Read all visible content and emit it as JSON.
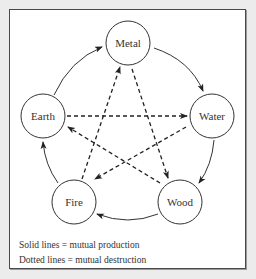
{
  "diagram": {
    "nodes": [
      {
        "id": "metal",
        "label": "Metal",
        "cx": 128,
        "cy": 43
      },
      {
        "id": "water",
        "label": "Water",
        "cx": 212,
        "cy": 116
      },
      {
        "id": "wood",
        "label": "Wood",
        "cx": 180,
        "cy": 202
      },
      {
        "id": "fire",
        "label": "Fire",
        "cx": 74,
        "cy": 202
      },
      {
        "id": "earth",
        "label": "Earth",
        "cx": 43,
        "cy": 116
      }
    ],
    "production_edges": [
      {
        "from": "Earth",
        "to": "Metal",
        "style": "solid"
      },
      {
        "from": "Metal",
        "to": "Water",
        "style": "solid"
      },
      {
        "from": "Water",
        "to": "Wood",
        "style": "solid"
      },
      {
        "from": "Wood",
        "to": "Fire",
        "style": "solid"
      },
      {
        "from": "Fire",
        "to": "Earth",
        "style": "solid"
      }
    ],
    "destruction_edges": [
      {
        "from": "Earth",
        "to": "Water",
        "style": "dashed"
      },
      {
        "from": "Water",
        "to": "Fire",
        "style": "dashed"
      },
      {
        "from": "Fire",
        "to": "Metal",
        "style": "dashed"
      },
      {
        "from": "Metal",
        "to": "Wood",
        "style": "dashed"
      },
      {
        "from": "Wood",
        "to": "Earth",
        "style": "dashed"
      }
    ],
    "legend": {
      "solid": "Solid lines = mutual production",
      "dotted": "Dotted lines = mutual destruction"
    },
    "colors": {
      "line": "#222222",
      "background": "#ffffff",
      "outer": "#ececec"
    }
  }
}
